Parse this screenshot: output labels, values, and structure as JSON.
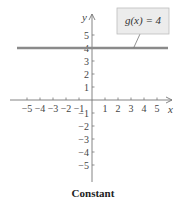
{
  "chart_data": {
    "type": "line",
    "title": "Constant",
    "xlabel": "x",
    "ylabel": "y",
    "xlim": [
      -5,
      5
    ],
    "ylim": [
      -5,
      5
    ],
    "grid": false,
    "x_ticks": [
      -5,
      -4,
      -3,
      -2,
      -1,
      1,
      2,
      3,
      4,
      5
    ],
    "y_ticks": [
      -5,
      -4,
      -3,
      -2,
      -1,
      1,
      2,
      3,
      4,
      5
    ],
    "x_tick_labels": [
      "−5",
      "−4",
      "−3",
      "−2",
      "−1",
      "1",
      "2",
      "3",
      "4",
      "5"
    ],
    "y_tick_labels": [
      "5",
      "4",
      "3",
      "2",
      "1",
      "−1",
      "−2",
      "−3",
      "−4",
      "−5"
    ],
    "series": [
      {
        "name": "g(x) = 4",
        "x": [
          -6,
          6
        ],
        "y": [
          4,
          4
        ],
        "color": "#8a8a8a"
      }
    ],
    "annotations": [
      {
        "text": "g(x) = 4",
        "points_to": [
          3.2,
          4
        ],
        "style": "callout-box"
      }
    ]
  },
  "labels": {
    "x_axis": "x",
    "y_axis": "y",
    "callout": "g(x) = 4",
    "caption": "Constant"
  },
  "colors": {
    "line": "#8a8a8a",
    "axis": "#777777",
    "callout_fill": "#ececec",
    "callout_border": "#bdbdbd"
  }
}
